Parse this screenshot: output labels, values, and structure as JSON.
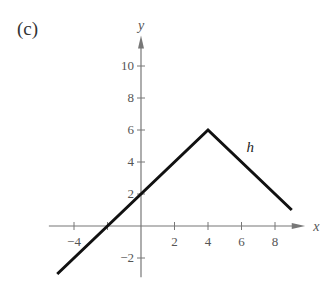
{
  "panel_label": "(c)",
  "chart_data": {
    "type": "line",
    "title": "",
    "xlabel": "x",
    "ylabel": "y",
    "xlim": [
      -5,
      9.5
    ],
    "ylim": [
      -3,
      11.5
    ],
    "grid": false,
    "x_ticks": [
      -4,
      2,
      4,
      6,
      8
    ],
    "x_tick_labels": [
      "−4",
      "2",
      "4",
      "6",
      "8"
    ],
    "x_unlabeled_ticks": [
      -2
    ],
    "y_ticks": [
      -2,
      2,
      4,
      6,
      8,
      10
    ],
    "y_tick_labels": [
      "−2",
      "2",
      "4",
      "6",
      "8",
      "10"
    ],
    "series": [
      {
        "name": "h",
        "x": [
          -5,
          4,
          9
        ],
        "y": [
          -3,
          6,
          1
        ]
      }
    ],
    "annotations": [
      {
        "text": "h",
        "x": 6.3,
        "y": 4.6
      }
    ]
  }
}
